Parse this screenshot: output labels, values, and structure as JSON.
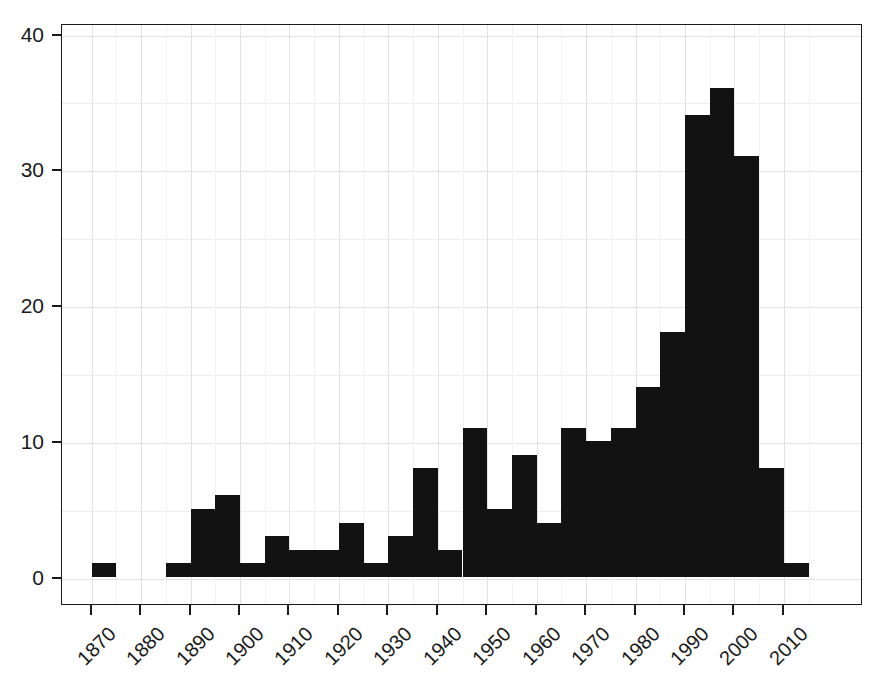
{
  "chart_data": {
    "type": "bar",
    "title": "",
    "subtitle": "",
    "xlabel": "",
    "ylabel": "",
    "grid": true,
    "legend": null,
    "bin_width": 5,
    "xlim": [
      1864,
      2026
    ],
    "ylim": [
      0,
      42
    ],
    "xticks": [
      1870,
      1880,
      1890,
      1900,
      1910,
      1920,
      1930,
      1940,
      1950,
      1960,
      1970,
      1980,
      1990,
      2000,
      2010
    ],
    "xtick_labels": [
      "1870",
      "1880",
      "1890",
      "1900",
      "1910",
      "1920",
      "1930",
      "1940",
      "1950",
      "1960",
      "1970",
      "1980",
      "1990",
      "2000",
      "2010"
    ],
    "yticks": [
      0,
      10,
      20,
      30,
      40
    ],
    "ytick_labels": [
      "0",
      "10",
      "20",
      "30",
      "40"
    ],
    "bin_edges": [
      1870,
      1875,
      1880,
      1885,
      1890,
      1895,
      1900,
      1905,
      1910,
      1915,
      1920,
      1925,
      1930,
      1935,
      1940,
      1945,
      1950,
      1955,
      1960,
      1965,
      1970,
      1975,
      1980,
      1985,
      1990,
      1995,
      2000,
      2005,
      2010,
      2015
    ],
    "categories": [
      "1870-1875",
      "1875-1880",
      "1880-1885",
      "1885-1890",
      "1890-1895",
      "1895-1900",
      "1900-1905",
      "1905-1910",
      "1910-1915",
      "1915-1920",
      "1920-1925",
      "1925-1930",
      "1930-1935",
      "1935-1940",
      "1940-1945",
      "1945-1950",
      "1950-1955",
      "1955-1960",
      "1960-1965",
      "1965-1970",
      "1970-1975",
      "1975-1980",
      "1980-1985",
      "1985-1990",
      "1990-1995",
      "1995-2000",
      "2000-2005",
      "2005-2010",
      "2010-2015"
    ],
    "values": [
      1,
      0,
      0,
      1,
      5,
      6,
      1,
      3,
      2,
      2,
      4,
      1,
      3,
      8,
      2,
      11,
      5,
      9,
      4,
      11,
      10,
      11,
      14,
      18,
      34,
      36,
      31,
      8,
      1
    ],
    "bar_color": "#121212",
    "grid_color": "#e2e2e2",
    "axis_color": "#1a1a1a",
    "background": "#ffffff"
  }
}
